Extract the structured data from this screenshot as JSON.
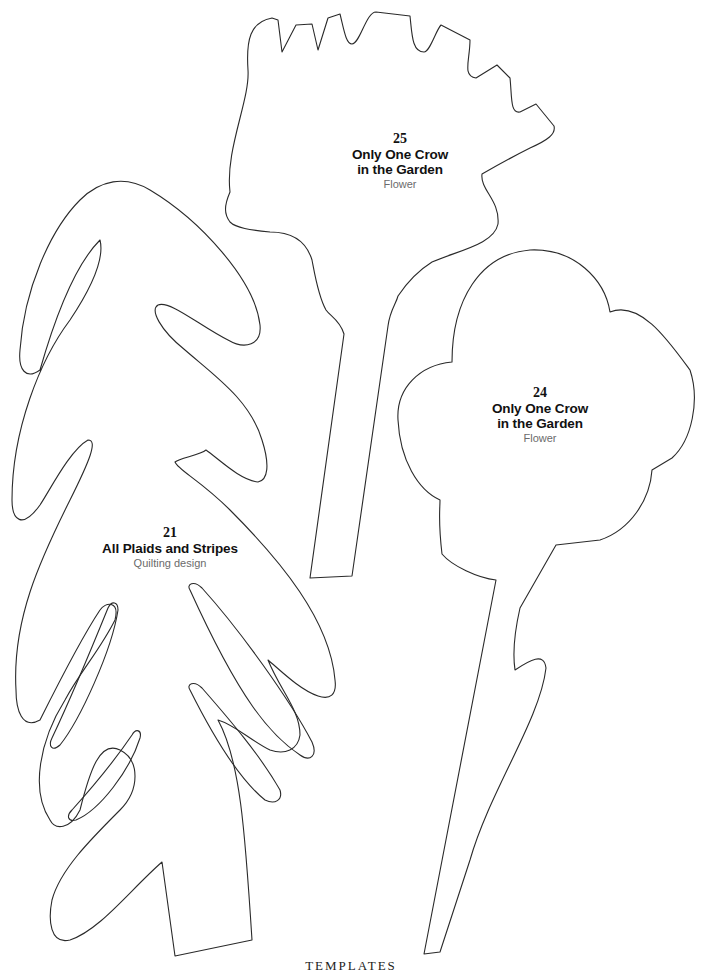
{
  "page": {
    "background": "#ffffff",
    "line_color": "#2a2a2a"
  },
  "templates": [
    {
      "id": "template-25",
      "number": "25",
      "title_line1": "Only One Crow",
      "title_line2": "in the Garden",
      "subtitle": "Flower",
      "shape": "crown-flower-with-stem"
    },
    {
      "id": "template-24",
      "number": "24",
      "title_line1": "Only One Crow",
      "title_line2": "in the Garden",
      "subtitle": "Flower",
      "shape": "round-flower-with-leafed-stem"
    },
    {
      "id": "template-21",
      "number": "21",
      "title_line1": "All Plaids and Stripes",
      "title_line2": "",
      "subtitle": "Quilting design",
      "shape": "tree"
    }
  ],
  "footer": {
    "text": "TEMPLATES"
  }
}
